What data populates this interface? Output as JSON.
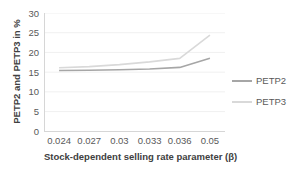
{
  "chart_data": {
    "type": "line",
    "categories": [
      "0.024",
      "0.027",
      "0.03",
      "0.033",
      "0.036",
      "0.05"
    ],
    "series": [
      {
        "name": "PETP2",
        "color": "#a6a6a6",
        "values": [
          15.4,
          15.5,
          15.6,
          15.8,
          16.2,
          18.5
        ]
      },
      {
        "name": "PETP3",
        "color": "#d9d9d9",
        "values": [
          16.1,
          16.4,
          16.9,
          17.6,
          18.5,
          24.4
        ]
      }
    ],
    "title": "",
    "xlabel": "Stock-dependent selling rate parameter (β)",
    "ylabel": "PETP2 and PETP3 in %",
    "ylim": [
      0,
      30
    ],
    "yticks": [
      0,
      5,
      10,
      15,
      20,
      25,
      30
    ],
    "grid": true,
    "legend_position": "right",
    "colors": {
      "gridline": "#f0f0f0",
      "axis_line": "#d6d6d6",
      "tick_text": "#595959",
      "title_text": "#404040"
    }
  }
}
